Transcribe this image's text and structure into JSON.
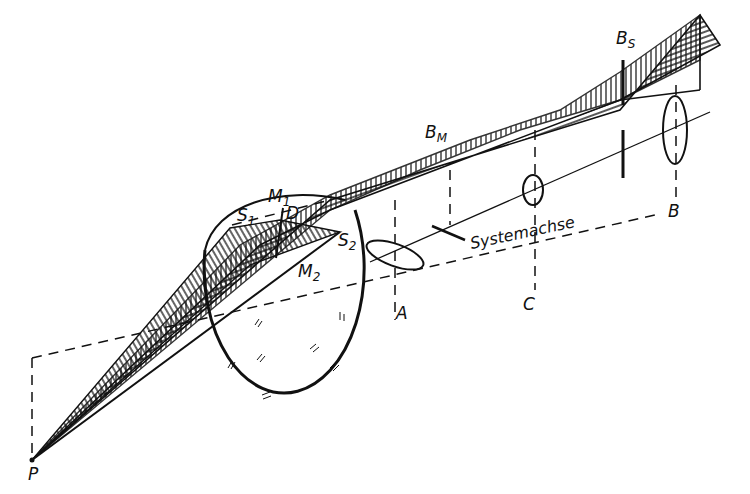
{
  "diagram": {
    "type": "optics-astigmatism-illustration",
    "colors": {
      "ink": "#111111",
      "paper": "#ffffff"
    },
    "labels": {
      "P": "P",
      "S1": {
        "main": "S",
        "sub": "1"
      },
      "S2": {
        "main": "S",
        "sub": "2"
      },
      "M1": {
        "main": "M",
        "sub": "1"
      },
      "M2": {
        "main": "M",
        "sub": "2"
      },
      "D": "D",
      "BM": {
        "main": "B",
        "sub": "M"
      },
      "BS": {
        "main": "B",
        "sub": "S"
      },
      "A": "A",
      "B": "B",
      "C": "C",
      "axis": "Systemachse"
    }
  }
}
